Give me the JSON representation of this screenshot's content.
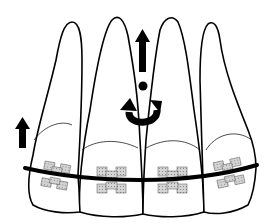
{
  "diagram": {
    "teeth": [
      {
        "id": "lateral-incisor-right",
        "position": 1
      },
      {
        "id": "central-incisor-right",
        "position": 2
      },
      {
        "id": "central-incisor-left",
        "position": 3
      },
      {
        "id": "lateral-incisor-left",
        "position": 4
      }
    ],
    "arrows": [
      {
        "id": "intrusion-arrow-lateral",
        "direction": "up"
      },
      {
        "id": "intrusion-arrow-central",
        "direction": "up"
      },
      {
        "id": "rotation-arrow",
        "direction": "counterclockwise-moment"
      }
    ],
    "colors": {
      "outline": "#000000",
      "background": "#ffffff",
      "bracket_fill": "#c8c8c8",
      "archwire": "#000000"
    }
  }
}
